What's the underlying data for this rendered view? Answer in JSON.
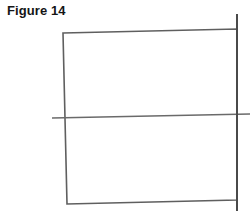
{
  "figure": {
    "caption": "Figure 14",
    "background_color": "#ffffff",
    "stroke_color": "#5f5f5f",
    "stroke_color_dark": "#4a4a4a",
    "canvas": {
      "width": 250,
      "height": 211
    },
    "shapes": [
      {
        "name": "quadrilateral",
        "type": "polygon",
        "stroke_width": 1.6,
        "points": [
          {
            "x": 63,
            "y": 33
          },
          {
            "x": 237,
            "y": 29
          },
          {
            "x": 237,
            "y": 200
          },
          {
            "x": 67,
            "y": 204
          }
        ]
      },
      {
        "name": "horizontal-crossing-line",
        "type": "line",
        "stroke_width": 1.5,
        "x1": 52,
        "y1": 118,
        "x2": 250,
        "y2": 114
      },
      {
        "name": "vertical-crossing-line",
        "type": "line",
        "stroke_width": 2.0,
        "x1": 237,
        "y1": 14,
        "x2": 237,
        "y2": 211
      }
    ]
  }
}
